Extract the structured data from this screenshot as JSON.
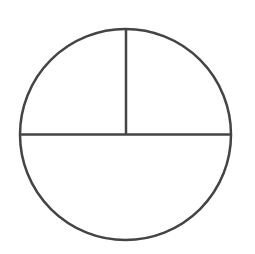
{
  "diagram": {
    "type": "fraction-circle",
    "stroke_color": "#444444",
    "fill_color": "#ffffff",
    "background": "#ffffff",
    "circle": {
      "cx": 125.5,
      "cy": 134.5,
      "r": 105.5,
      "stroke_width": 2.5
    },
    "lines": [
      {
        "name": "horizontal-diameter",
        "x1": 20,
        "y1": 134.5,
        "x2": 231,
        "y2": 134.5
      },
      {
        "name": "vertical-radius-top",
        "x1": 126,
        "y1": 29,
        "x2": 126,
        "y2": 134.5
      }
    ],
    "regions": [
      {
        "name": "top-left-quarter",
        "fraction": "1/4"
      },
      {
        "name": "top-right-quarter",
        "fraction": "1/4"
      },
      {
        "name": "bottom-half",
        "fraction": "1/2"
      }
    ]
  }
}
